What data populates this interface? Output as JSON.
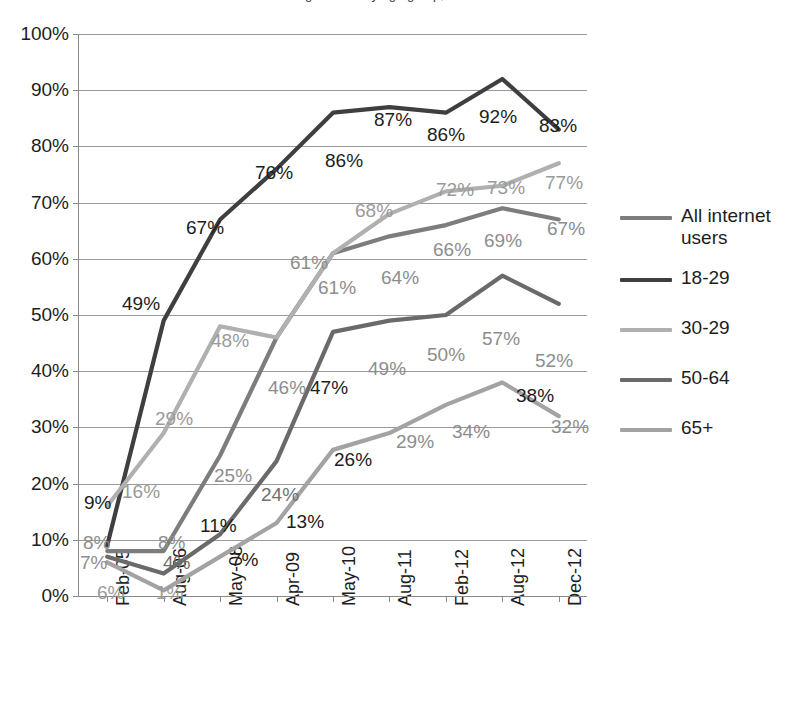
{
  "chart_data": {
    "type": "line",
    "title": "Social networking site use by age group, 2005-2012",
    "xlabel": "",
    "ylabel": "",
    "ylim": [
      0,
      100
    ],
    "ytick_labels": [
      "100%",
      "90%",
      "80%",
      "70%",
      "60%",
      "50%",
      "40%",
      "30%",
      "20%",
      "10%",
      "0%"
    ],
    "ytick_values": [
      100,
      90,
      80,
      70,
      60,
      50,
      40,
      30,
      20,
      10,
      0
    ],
    "grid": true,
    "legend_position": "right",
    "categories": [
      "Feb-05",
      "Aug-06",
      "May-08",
      "Apr-09",
      "May-10",
      "Aug-11",
      "Feb-12",
      "Aug-12",
      "Dec-12"
    ],
    "series": [
      {
        "name": "All internet users",
        "color": "#7d7d7d",
        "values": [
          8,
          8,
          25,
          46,
          61,
          64,
          66,
          69,
          67
        ],
        "labels": [
          "8%",
          "8%",
          "25%",
          "46%",
          "61%",
          "64%",
          "66%",
          "69%",
          "67%"
        ]
      },
      {
        "name": "18-29",
        "color": "#3f3f3f",
        "values": [
          9,
          49,
          67,
          76,
          86,
          87,
          86,
          92,
          83
        ],
        "labels": [
          "9%",
          "49%",
          "67%",
          "76%",
          "86%",
          "87%",
          "86%",
          "92%",
          "83%"
        ]
      },
      {
        "name": "30-29",
        "color": "#b0b0b0",
        "values": [
          16,
          29,
          48,
          46,
          61,
          68,
          72,
          73,
          77
        ],
        "labels": [
          "16%",
          "29%",
          "48%",
          "46%",
          "61%",
          "68%",
          "72%",
          "73%",
          "77%"
        ]
      },
      {
        "name": "50-64",
        "color": "#6a6a6a",
        "values": [
          7,
          4,
          11,
          24,
          47,
          49,
          50,
          57,
          52
        ],
        "labels": [
          "7%",
          "4%",
          "11%",
          "24%",
          "47%",
          "49%",
          "50%",
          "57%",
          "52%"
        ]
      },
      {
        "name": "65+",
        "color": "#a3a3a3",
        "values": [
          6,
          1,
          7,
          13,
          26,
          29,
          34,
          38,
          32
        ],
        "labels": [
          "6%",
          "1%",
          "7%",
          "13%",
          "26%",
          "29%",
          "34%",
          "38%",
          "32%"
        ]
      }
    ]
  },
  "legend": {
    "entries": [
      {
        "label": "All internet users",
        "color": "#7d7d7d"
      },
      {
        "label": "18-29",
        "color": "#3f3f3f"
      },
      {
        "label": "30-29",
        "color": "#b0b0b0"
      },
      {
        "label": "50-64",
        "color": "#6a6a6a"
      },
      {
        "label": "65+",
        "color": "#a3a3a3"
      }
    ]
  },
  "annotations": [
    {
      "text": "9%",
      "x": 84,
      "y": 493,
      "color": "#1d1d1d"
    },
    {
      "text": "16%",
      "x": 122,
      "y": 482,
      "color": "#9a9a9a"
    },
    {
      "text": "8%",
      "x": 83,
      "y": 533,
      "color": "#8d8d8d"
    },
    {
      "text": "7%",
      "x": 80,
      "y": 553,
      "color": "#8d8d8d"
    },
    {
      "text": "6%",
      "x": 97,
      "y": 583,
      "color": "#9a9a9a"
    },
    {
      "text": "49%",
      "x": 122,
      "y": 294,
      "color": "#1d1d1d"
    },
    {
      "text": "29%",
      "x": 155,
      "y": 409,
      "color": "#9a9a9a"
    },
    {
      "text": "8%",
      "x": 158,
      "y": 533,
      "color": "#8d8d8d"
    },
    {
      "text": "4%",
      "x": 163,
      "y": 553,
      "color": "#6f6f6f"
    },
    {
      "text": "1%",
      "x": 156,
      "y": 583,
      "color": "#9a9a9a"
    },
    {
      "text": "67%",
      "x": 186,
      "y": 218,
      "color": "#1d1d1d"
    },
    {
      "text": "48%",
      "x": 211,
      "y": 331,
      "color": "#9a9a9a"
    },
    {
      "text": "25%",
      "x": 214,
      "y": 466,
      "color": "#8d8d8d"
    },
    {
      "text": "11%",
      "x": 200,
      "y": 516,
      "color": "#1d1d1d"
    },
    {
      "text": "7%",
      "x": 231,
      "y": 550,
      "color": "#1d1d1d"
    },
    {
      "text": "76%",
      "x": 255,
      "y": 163,
      "color": "#1d1d1d"
    },
    {
      "text": "46%",
      "x": 268,
      "y": 378,
      "color": "#8d8d8d"
    },
    {
      "text": "24%",
      "x": 261,
      "y": 485,
      "color": "#6f6f6f"
    },
    {
      "text": "13%",
      "x": 286,
      "y": 512,
      "color": "#1d1d1d"
    },
    {
      "text": "86%",
      "x": 325,
      "y": 151,
      "color": "#1d1d1d"
    },
    {
      "text": "68%",
      "x": 355,
      "y": 201,
      "color": "#9a9a9a"
    },
    {
      "text": "61%",
      "x": 290,
      "y": 253,
      "color": "#8d8d8d"
    },
    {
      "text": "61%",
      "x": 318,
      "y": 278,
      "color": "#8d8d8d"
    },
    {
      "text": "47%",
      "x": 310,
      "y": 378,
      "color": "#1d1d1d"
    },
    {
      "text": "26%",
      "x": 334,
      "y": 450,
      "color": "#1d1d1d"
    },
    {
      "text": "87%",
      "x": 374,
      "y": 110,
      "color": "#1d1d1d"
    },
    {
      "text": "64%",
      "x": 381,
      "y": 268,
      "color": "#8d8d8d"
    },
    {
      "text": "49%",
      "x": 368,
      "y": 359,
      "color": "#8d8d8d"
    },
    {
      "text": "29%",
      "x": 396,
      "y": 432,
      "color": "#8d8d8d"
    },
    {
      "text": "86%",
      "x": 427,
      "y": 125,
      "color": "#1d1d1d"
    },
    {
      "text": "72%",
      "x": 436,
      "y": 180,
      "color": "#9a9a9a"
    },
    {
      "text": "66%",
      "x": 433,
      "y": 240,
      "color": "#8d8d8d"
    },
    {
      "text": "50%",
      "x": 427,
      "y": 345,
      "color": "#8d8d8d"
    },
    {
      "text": "34%",
      "x": 452,
      "y": 422,
      "color": "#8d8d8d"
    },
    {
      "text": "92%",
      "x": 479,
      "y": 107,
      "color": "#1d1d1d"
    },
    {
      "text": "73%",
      "x": 487,
      "y": 178,
      "color": "#9a9a9a"
    },
    {
      "text": "69%",
      "x": 484,
      "y": 231,
      "color": "#8d8d8d"
    },
    {
      "text": "57%",
      "x": 482,
      "y": 329,
      "color": "#8d8d8d"
    },
    {
      "text": "38%",
      "x": 516,
      "y": 386,
      "color": "#1d1d1d"
    },
    {
      "text": "83%",
      "x": 539,
      "y": 116,
      "color": "#1d1d1d"
    },
    {
      "text": "77%",
      "x": 545,
      "y": 173,
      "color": "#9a9a9a"
    },
    {
      "text": "67%",
      "x": 547,
      "y": 219,
      "color": "#8d8d8d"
    },
    {
      "text": "52%",
      "x": 535,
      "y": 351,
      "color": "#8d8d8d"
    },
    {
      "text": "32%",
      "x": 551,
      "y": 417,
      "color": "#8d8d8d"
    }
  ]
}
